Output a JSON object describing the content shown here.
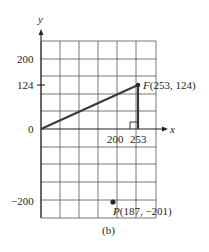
{
  "figure": {
    "caption": "(b)",
    "axes": {
      "x_label": "x",
      "y_label": "y",
      "origin_label": "0",
      "x_ticks": [
        "200",
        "253"
      ],
      "y_ticks": [
        "200",
        "124",
        "−200"
      ]
    },
    "points": {
      "F": {
        "name": "F",
        "coords": "(253, 124)",
        "x": 253,
        "y": 124
      },
      "P": {
        "name": "P",
        "coords": "(187, −201)",
        "x": 187,
        "y": -201
      }
    },
    "segments": [
      {
        "from": "origin",
        "to": "F",
        "description": "line from origin to F"
      },
      {
        "from": "F",
        "to": "(253, 0)",
        "description": "vertical drop with right-angle marker"
      }
    ],
    "colors": {
      "grid": "#4a4a4a",
      "line": "#3a3a3a",
      "point": "#2a2a2a"
    }
  }
}
